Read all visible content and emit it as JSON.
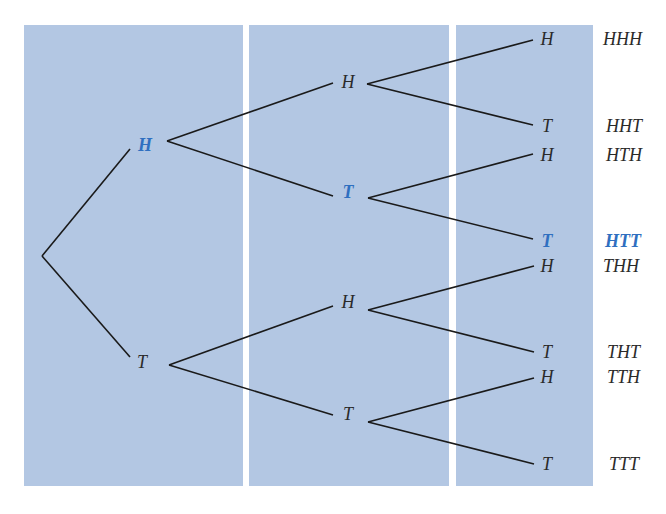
{
  "colors": {
    "panel_fill": "#b3c7e3",
    "highlight": "#2f6fc0",
    "line": "#1a1a1a",
    "background": "#ffffff"
  },
  "tree": {
    "root": {
      "x": 42,
      "y": 256
    },
    "level1": [
      {
        "label": "H",
        "x": 145,
        "y": 143,
        "highlight": true
      },
      {
        "label": "T",
        "x": 142,
        "y": 361,
        "highlight": false
      }
    ],
    "level2": [
      {
        "label": "H",
        "x": 347,
        "y": 83,
        "highlight": false,
        "parent": 0
      },
      {
        "label": "T",
        "x": 347,
        "y": 192,
        "highlight": true,
        "parent": 0
      },
      {
        "label": "H",
        "x": 347,
        "y": 302,
        "highlight": false,
        "parent": 1
      },
      {
        "label": "T",
        "x": 347,
        "y": 413,
        "highlight": false,
        "parent": 1
      }
    ],
    "level3": [
      {
        "label": "H",
        "x": 548,
        "y": 39,
        "highlight": false,
        "parent": 0
      },
      {
        "label": "T",
        "x": 548,
        "y": 126,
        "highlight": false,
        "parent": 0
      },
      {
        "label": "H",
        "x": 548,
        "y": 155,
        "highlight": false,
        "parent": 1
      },
      {
        "label": "T",
        "x": 548,
        "y": 241,
        "highlight": true,
        "parent": 1
      },
      {
        "label": "H",
        "x": 548,
        "y": 266,
        "highlight": false,
        "parent": 2
      },
      {
        "label": "T",
        "x": 548,
        "y": 352,
        "highlight": false,
        "parent": 2
      },
      {
        "label": "H",
        "x": 548,
        "y": 377,
        "highlight": false,
        "parent": 3
      },
      {
        "label": "T",
        "x": 548,
        "y": 464,
        "highlight": false,
        "parent": 3
      }
    ]
  },
  "outcomes": [
    {
      "label": "HHH",
      "y": 39,
      "highlight": false
    },
    {
      "label": "HHT",
      "y": 126,
      "highlight": false
    },
    {
      "label": "HTH",
      "y": 155,
      "highlight": false
    },
    {
      "label": "HTT",
      "y": 241,
      "highlight": true
    },
    {
      "label": "THH",
      "y": 266,
      "highlight": false
    },
    {
      "label": "THT",
      "y": 352,
      "highlight": false
    },
    {
      "label": "TTH",
      "y": 377,
      "highlight": false
    },
    {
      "label": "TTT",
      "y": 464,
      "highlight": false
    }
  ],
  "panels": [
    {
      "x": 24,
      "y": 25,
      "w": 219,
      "h": 461
    },
    {
      "x": 249,
      "y": 25,
      "w": 200,
      "h": 461
    },
    {
      "x": 456,
      "y": 25,
      "w": 137,
      "h": 461
    }
  ]
}
